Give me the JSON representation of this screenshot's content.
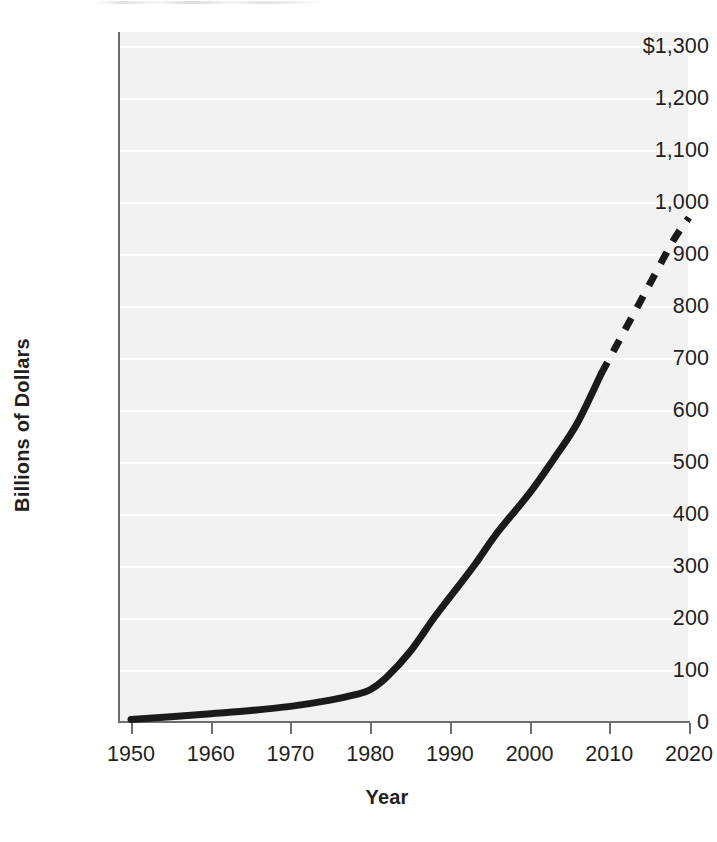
{
  "chart_data": {
    "type": "line",
    "title": "",
    "subtitle": "",
    "xlabel": "Year",
    "ylabel": "Billions of Dollars",
    "xlim": [
      1950,
      2020
    ],
    "ylim": [
      0,
      1300
    ],
    "grid": true,
    "grid_orientation": "horizontal",
    "legend": "none",
    "legend_position": "none",
    "y_ticks": [
      {
        "value": 1300,
        "label": "$1,300"
      },
      {
        "value": 1200,
        "label": "1,200"
      },
      {
        "value": 1100,
        "label": "1,100"
      },
      {
        "value": 1000,
        "label": "1,000"
      },
      {
        "value": 900,
        "label": "900"
      },
      {
        "value": 800,
        "label": "800"
      },
      {
        "value": 700,
        "label": "700"
      },
      {
        "value": 600,
        "label": "600"
      },
      {
        "value": 500,
        "label": "500"
      },
      {
        "value": 400,
        "label": "400"
      },
      {
        "value": 300,
        "label": "300"
      },
      {
        "value": 200,
        "label": "200"
      },
      {
        "value": 100,
        "label": "100"
      },
      {
        "value": 0,
        "label": "0"
      }
    ],
    "x_ticks": [
      {
        "value": 1950,
        "label": "1950"
      },
      {
        "value": 1960,
        "label": "1960"
      },
      {
        "value": 1970,
        "label": "1970"
      },
      {
        "value": 1980,
        "label": "1980"
      },
      {
        "value": 1990,
        "label": "1990"
      },
      {
        "value": 2000,
        "label": "2000"
      },
      {
        "value": 2010,
        "label": "2010"
      },
      {
        "value": 2020,
        "label": "2020"
      }
    ],
    "series": [
      {
        "name": "Actual",
        "style": "solid",
        "color": "#1a1a1a",
        "linewidth": 7,
        "x": [
          1950,
          1955,
          1960,
          1965,
          1970,
          1975,
          1978,
          1980,
          1982,
          1985,
          1988,
          1990,
          1993,
          1996,
          2000,
          2003,
          2006,
          2009
        ],
        "values": [
          5,
          10,
          16,
          22,
          30,
          42,
          52,
          62,
          85,
          135,
          200,
          240,
          300,
          365,
          440,
          505,
          575,
          670
        ]
      },
      {
        "name": "Projected",
        "style": "dashed",
        "color": "#1a1a1a",
        "linewidth": 7,
        "x": [
          2009,
          2012,
          2015,
          2018,
          2020
        ],
        "values": [
          670,
          755,
          840,
          925,
          970
        ]
      }
    ],
    "annotations": []
  }
}
